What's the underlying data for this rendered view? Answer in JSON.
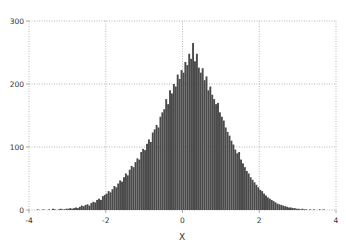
{
  "chart_data": {
    "type": "bar",
    "subtype": "histogram",
    "title": "",
    "xlabel": "X",
    "ylabel": "",
    "xlim": [
      -4,
      4
    ],
    "ylim": [
      0,
      300
    ],
    "xticks": [
      -4,
      -2,
      0,
      2,
      4
    ],
    "yticks": [
      0,
      100,
      200,
      300
    ],
    "xtick_labels": [
      "-4",
      "-2",
      "0",
      "2",
      "4"
    ],
    "ytick_labels": [
      "0",
      "100",
      "200",
      "300"
    ],
    "grid": true,
    "legend": null,
    "bar_color": "#4a4a4a",
    "bin_start": -3.8,
    "bin_width": 0.05,
    "values": [
      1,
      0,
      0,
      1,
      0,
      0,
      1,
      0,
      2,
      1,
      0,
      1,
      2,
      1,
      1,
      2,
      2,
      3,
      2,
      3,
      4,
      3,
      5,
      7,
      6,
      8,
      9,
      7,
      11,
      13,
      12,
      16,
      18,
      16,
      22,
      24,
      26,
      30,
      28,
      33,
      38,
      36,
      42,
      47,
      45,
      52,
      58,
      55,
      64,
      70,
      68,
      76,
      82,
      80,
      92,
      97,
      95,
      105,
      112,
      108,
      123,
      128,
      135,
      131,
      148,
      155,
      160,
      176,
      168,
      190,
      185,
      200,
      196,
      215,
      208,
      222,
      218,
      235,
      230,
      248,
      240,
      265,
      236,
      248,
      226,
      218,
      225,
      206,
      212,
      190,
      196,
      183,
      176,
      168,
      170,
      155,
      148,
      142,
      131,
      124,
      118,
      110,
      104,
      96,
      90,
      92,
      80,
      74,
      68,
      62,
      58,
      52,
      48,
      44,
      40,
      36,
      32,
      30,
      26,
      23,
      20,
      18,
      16,
      14,
      12,
      10,
      9,
      8,
      7,
      6,
      5,
      4,
      4,
      3,
      3,
      2,
      2,
      1,
      2,
      1,
      1,
      0,
      1,
      0,
      1,
      0,
      0,
      1,
      0,
      1
    ]
  },
  "axes": {
    "x_label": "X",
    "x_tick_labels": [
      "-4",
      "-2",
      "0",
      "2",
      "4"
    ],
    "y_tick_labels": [
      "0",
      "100",
      "200",
      "300"
    ]
  }
}
